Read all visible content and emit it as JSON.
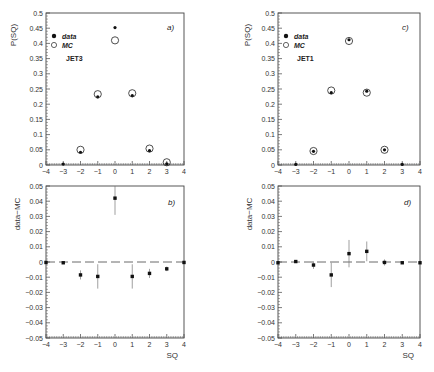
{
  "figure": {
    "x_axis_label": "SQ",
    "top_y_label": "P(SQ)",
    "bottom_y_label": "data−MC",
    "legend": {
      "data": "data",
      "mc": "MC"
    }
  },
  "chart_data": [
    {
      "panel": "a)",
      "type": "scatter",
      "annotation": "JET3",
      "xlabel": "",
      "ylabel": "P(SQ)",
      "xlim": [
        -4,
        4
      ],
      "ylim": [
        0,
        0.5
      ],
      "x_ticks": [
        -4,
        -3,
        -2,
        -1,
        0,
        1,
        2,
        3,
        4
      ],
      "y_ticks": [
        0,
        0.05,
        0.1,
        0.15,
        0.2,
        0.25,
        0.3,
        0.35,
        0.4,
        0.45,
        0.5
      ],
      "legend": [
        "data",
        "MC"
      ],
      "series": [
        {
          "name": "data",
          "marker": "filled-circle",
          "x": [
            -3,
            -2,
            -1,
            0,
            1,
            2,
            3
          ],
          "y": [
            0.003,
            0.042,
            0.224,
            0.452,
            0.228,
            0.047,
            0.004
          ]
        },
        {
          "name": "MC",
          "marker": "open-circle",
          "x": [
            -2,
            -1,
            0,
            1,
            2,
            3
          ],
          "y": [
            0.05,
            0.233,
            0.41,
            0.236,
            0.054,
            0.009
          ]
        }
      ]
    },
    {
      "panel": "b)",
      "type": "scatter",
      "xlabel": "SQ",
      "ylabel": "data−MC",
      "xlim": [
        -4,
        4
      ],
      "ylim": [
        -0.05,
        0.05
      ],
      "x_ticks": [
        -4,
        -3,
        -2,
        -1,
        0,
        1,
        2,
        3,
        4
      ],
      "y_ticks": [
        -0.05,
        -0.04,
        -0.03,
        -0.02,
        -0.01,
        0,
        0.01,
        0.02,
        0.03,
        0.04,
        0.05
      ],
      "reference_line": 0,
      "series": [
        {
          "name": "data-MC",
          "x": [
            -4,
            -3,
            -2,
            -1,
            0,
            1,
            2,
            3,
            4
          ],
          "y": [
            -0.0003,
            -0.0005,
            -0.0085,
            -0.0095,
            0.042,
            -0.0095,
            -0.0075,
            -0.0045,
            -0.0003
          ],
          "err": [
            0.0005,
            0.0008,
            0.003,
            0.008,
            0.011,
            0.008,
            0.003,
            0.0015,
            0.0005
          ]
        }
      ]
    },
    {
      "panel": "c)",
      "type": "scatter",
      "annotation": "JET1",
      "xlabel": "",
      "ylabel": "P(SQ)",
      "xlim": [
        -4,
        4
      ],
      "ylim": [
        0,
        0.5
      ],
      "x_ticks": [
        -4,
        -3,
        -2,
        -1,
        0,
        1,
        2,
        3,
        4
      ],
      "y_ticks": [
        0,
        0.05,
        0.1,
        0.15,
        0.2,
        0.25,
        0.3,
        0.35,
        0.4,
        0.45,
        0.5
      ],
      "legend": [
        "data",
        "MC"
      ],
      "series": [
        {
          "name": "data",
          "marker": "filled-circle",
          "x": [
            -3,
            -2,
            -1,
            0,
            1,
            2,
            3
          ],
          "y": [
            0.002,
            0.045,
            0.238,
            0.412,
            0.243,
            0.05,
            0.002
          ]
        },
        {
          "name": "MC",
          "marker": "open-circle",
          "x": [
            -2,
            -1,
            0,
            1,
            2
          ],
          "y": [
            0.046,
            0.245,
            0.408,
            0.238,
            0.05
          ]
        }
      ]
    },
    {
      "panel": "d)",
      "type": "scatter",
      "xlabel": "SQ",
      "ylabel": "data−MC",
      "xlim": [
        -4,
        4
      ],
      "ylim": [
        -0.05,
        0.05
      ],
      "x_ticks": [
        -4,
        -3,
        -2,
        -1,
        0,
        1,
        2,
        3,
        4
      ],
      "y_ticks": [
        -0.05,
        -0.04,
        -0.03,
        -0.02,
        -0.01,
        0,
        0.01,
        0.02,
        0.03,
        0.04,
        0.05
      ],
      "reference_line": 0,
      "series": [
        {
          "name": "data-MC",
          "x": [
            -4,
            -3,
            -2,
            -1,
            0,
            1,
            2,
            3,
            4
          ],
          "y": [
            -0.0005,
            0.0003,
            -0.002,
            -0.0085,
            0.0055,
            0.007,
            -0.0003,
            -0.0005,
            -0.0005
          ],
          "err": [
            0.0005,
            0.0005,
            0.0025,
            0.008,
            0.009,
            0.0065,
            0.002,
            0.0005,
            0.0005
          ]
        }
      ]
    }
  ]
}
